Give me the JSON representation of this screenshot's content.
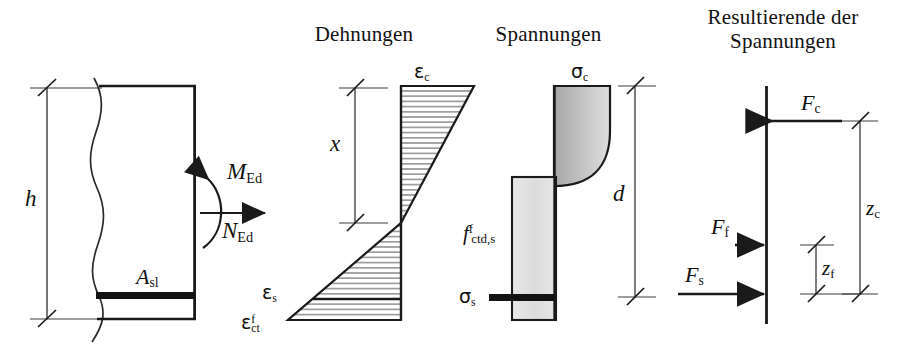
{
  "figure": {
    "kind": "reinforced-concrete-section-analysis",
    "language": "de"
  },
  "titles": {
    "strains": "Dehnungen",
    "stresses": "Spannungen",
    "resultants_line1": "Resultierende der",
    "resultants_line2": "Spannungen"
  },
  "cross_section": {
    "height_label": "h",
    "rebar_label_base": "A",
    "rebar_label_sub": "sl",
    "moment_label_base": "M",
    "moment_label_sub": "Ed",
    "normal_force_label_base": "N",
    "normal_force_label_sub": "Ed"
  },
  "strain_diagram": {
    "depth_label": "x",
    "concrete_strain_base": "ε",
    "concrete_strain_sub": "c",
    "steel_strain_base": "ε",
    "steel_strain_sub": "s",
    "fibre_strain_base": "ε",
    "fibre_strain_sup": "f",
    "fibre_strain_sub": "ct"
  },
  "stress_diagram": {
    "concrete_stress_base": "σ",
    "concrete_stress_sub": "c",
    "steel_stress_base": "σ",
    "steel_stress_sub": "s",
    "fibre_strength_base": "f",
    "fibre_strength_sup": "f",
    "fibre_strength_sub": "ctd,s",
    "effective_depth_label": "d"
  },
  "resultants": {
    "force_c_base": "F",
    "force_c_sub": "c",
    "force_f_base": "F",
    "force_f_sub": "f",
    "force_s_base": "F",
    "force_s_sub": "s",
    "lever_c_base": "z",
    "lever_c_sub": "c",
    "lever_f_base": "z",
    "lever_f_sub": "f"
  },
  "colors": {
    "ink": "#1a1a1a",
    "thin_line": "#3a3a3a",
    "compression_fill_dark": "#9d9d9d",
    "compression_fill_light": "#d8d8d8",
    "tension_fill": "#e2e2e2",
    "hatch": "#6d6d6d",
    "background": "#ffffff"
  }
}
